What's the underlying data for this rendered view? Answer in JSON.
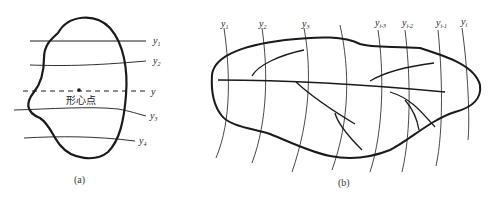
{
  "panel_a": {
    "caption": "(a)",
    "centroid_label": "形心点",
    "axis_label": "y",
    "lines": [
      {
        "label": "y",
        "sub": "1"
      },
      {
        "label": "y",
        "sub": "2"
      },
      {
        "label": "y",
        "sub": "3"
      },
      {
        "label": "y",
        "sub": "4"
      }
    ]
  },
  "panel_b": {
    "caption": "(b)",
    "lines": [
      {
        "label": "y",
        "sub": "1"
      },
      {
        "label": "y",
        "sub": "2"
      },
      {
        "label": "y",
        "sub": "3"
      },
      {
        "label": "y",
        "sub": "i-3"
      },
      {
        "label": "y",
        "sub": "i-2"
      },
      {
        "label": "y",
        "sub": "i-1"
      },
      {
        "label": "y",
        "sub": "i"
      }
    ]
  },
  "colors": {
    "stroke": "#1a1a1a",
    "background": "#ffffff"
  }
}
